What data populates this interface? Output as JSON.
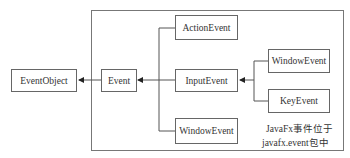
{
  "diagram": {
    "type": "class-hierarchy",
    "nodes": {
      "event_object": "EventObject",
      "event": "Event",
      "action_event": "ActionEvent",
      "input_event": "InputEvent",
      "window_event_left": "WindowEvent",
      "window_event_right": "WindowEvent",
      "key_event": "KeyEvent"
    },
    "edges": [
      {
        "from": "Event",
        "to": "EventObject",
        "type": "inherits"
      },
      {
        "from": "ActionEvent",
        "to": "Event",
        "type": "inherits"
      },
      {
        "from": "InputEvent",
        "to": "Event",
        "type": "inherits"
      },
      {
        "from": "WindowEvent",
        "to": "Event",
        "type": "inherits"
      },
      {
        "from": "WindowEvent",
        "to": "InputEvent",
        "type": "inherits"
      },
      {
        "from": "KeyEvent",
        "to": "InputEvent",
        "type": "inherits"
      }
    ],
    "caption": {
      "line1": "JavaFx事件位于",
      "line2": "javafx.event包中"
    },
    "colors": {
      "line": "#555555",
      "border": "#666666",
      "text": "#333333"
    }
  }
}
